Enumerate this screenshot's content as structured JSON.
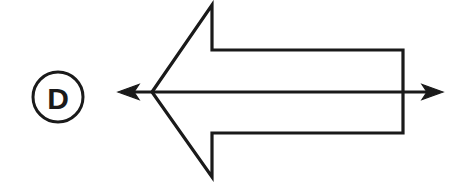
{
  "figure": {
    "width": 471,
    "height": 183,
    "background_color": "#ffffff",
    "stroke_color": "#1a1a1a"
  },
  "label_badge": {
    "text": "D",
    "shape": "circle",
    "center_x": 58,
    "center_y": 97,
    "radius": 25,
    "stroke_width": 3,
    "stroke_color": "#1a1a1a",
    "fill_color": "#ffffff",
    "font_size": 30,
    "font_weight": "bold"
  },
  "block_arrow": {
    "name": "left-pointing-block-arrow",
    "direction": "left",
    "fill_color": "#ffffff",
    "stroke_color": "#1a1a1a",
    "stroke_width": 3.2,
    "apex_x": 152,
    "apex_y": 92,
    "barb_tip_x": 212,
    "barb_top_y": 5,
    "barb_bottom_y": 177,
    "shaft_top_y": 50,
    "shaft_bottom_y": 133,
    "tail_x": 403,
    "points": "152,92 212,5 212,50 403,50 403,133 212,133 212,177"
  },
  "axis_arrow": {
    "name": "bidirectional-axis-arrow",
    "direction": "both",
    "stroke_color": "#1a1a1a",
    "stroke_width": 3.2,
    "line_y": 92,
    "left_tip_x": 118,
    "right_tip_x": 443,
    "head_length": 20,
    "head_half_height": 7.5
  }
}
